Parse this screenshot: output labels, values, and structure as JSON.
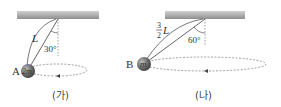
{
  "figures": [
    {
      "caption": "(가)",
      "ball_label": "A",
      "ball_mass": "2m",
      "string_length": "L",
      "angle": "30°"
    },
    {
      "caption": "(나)",
      "ball_label": "B",
      "ball_mass": "m",
      "string_length_num": "3",
      "string_length_den": "2",
      "string_length_var": "L",
      "angle": "60°"
    }
  ],
  "colors": {
    "ceiling": "#a8a8a8",
    "ball": "#6a6a6a",
    "string": "#555555",
    "dashed": "#777777"
  }
}
